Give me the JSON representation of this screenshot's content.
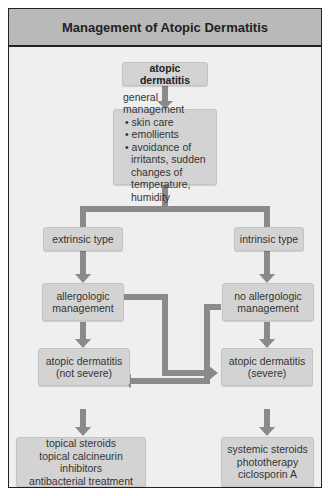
{
  "header": {
    "title": "Management of Atopic Dermatitis"
  },
  "nodes": {
    "root": "atopic dermatitis",
    "general": {
      "title": "general management",
      "items": [
        "skin care",
        "emollients",
        "avoidance of irritants, sudden changes of temperature, humidity"
      ]
    },
    "extrinsic": "extrinsic type",
    "intrinsic": "intrinsic type",
    "allergologic": {
      "line1": "allergologic",
      "line2": "management"
    },
    "no_allergologic": {
      "line1": "no allergologic",
      "line2": "management"
    },
    "ad_not_severe": {
      "line1": "atopic dermatitis",
      "line2": "(not severe)"
    },
    "ad_severe": {
      "line1": "atopic dermatitis",
      "line2": "(severe)"
    },
    "treatment_left": [
      "topical steroids",
      "topical calcineurin inhibitors",
      "antibacterial treatment"
    ],
    "treatment_right": [
      "systemic steroids",
      "phototherapy",
      "ciclosporin A"
    ]
  },
  "colors": {
    "arrow": "#8a8a8a",
    "box": "#d3d3d3",
    "header": "#b9b9b9",
    "background": "#efefef"
  }
}
